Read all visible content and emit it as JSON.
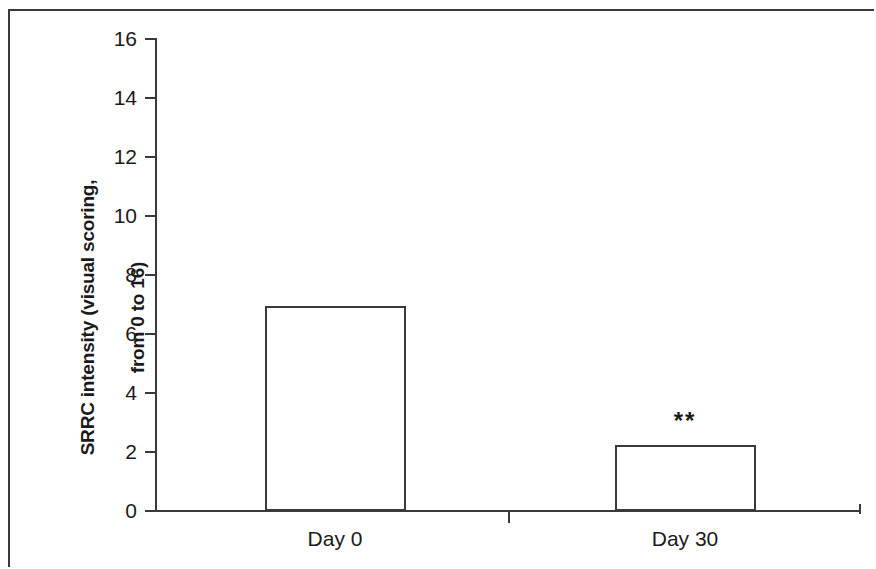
{
  "chart_data": {
    "type": "bar",
    "title": "",
    "subtitle": "",
    "xlabel": "",
    "ylabel": "SRRC intensity (visual scoring, from 0 to 16)",
    "ylabel_lines": [
      "SRRC intensity (visual scoring,",
      "from 0  to 16)"
    ],
    "categories": [
      "Day 0",
      "Day 30"
    ],
    "values": [
      6.95,
      2.25
    ],
    "ylim": [
      0,
      16
    ],
    "yticks": [
      0,
      2,
      4,
      6,
      8,
      10,
      12,
      14,
      16
    ],
    "ytick_labels": [
      "0",
      "2",
      "4",
      "6",
      "8",
      "10",
      "12",
      "14",
      "16"
    ],
    "grid": false,
    "legend": false,
    "legend_position": "none",
    "bar_style": "open-outline",
    "bar_fill_color": "#ffffff",
    "bar_edge_color": "#3a3a3a",
    "axis_color": "#3a3a3a",
    "background_color": "#ffffff",
    "annotations": [
      {
        "category": "Day 30",
        "text": "**",
        "meaning": "significance marker"
      }
    ]
  },
  "figure": {
    "border_color": "#3a3a3a"
  }
}
